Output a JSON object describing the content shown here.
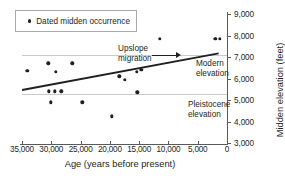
{
  "chart_data": {
    "type": "scatter",
    "title": "",
    "xlabel": "Age (years before present)",
    "ylabel": "Midden elevation (feet)",
    "xlim": [
      35000,
      0
    ],
    "ylim": [
      3000,
      9000
    ],
    "x_ticks": [
      "35,000",
      "30,000",
      "25,000",
      "20,000",
      "15,000",
      "10,000",
      "5,000",
      "0"
    ],
    "x_tick_values": [
      35000,
      30000,
      25000,
      20000,
      15000,
      10000,
      5000,
      0
    ],
    "y_ticks": [
      "9,000",
      "8,000",
      "7,000",
      "6,000",
      "5,000",
      "4,000",
      "3,000"
    ],
    "y_tick_values": [
      9000,
      8000,
      7000,
      6000,
      5000,
      4000,
      3000
    ],
    "grid": false,
    "legend_position": "top-left",
    "legend": [
      "Dated midden occurrence"
    ],
    "series": [
      {
        "name": "Dated midden occurrence",
        "points": [
          {
            "x": 34100,
            "y": 6350
          },
          {
            "x": 30500,
            "y": 6700
          },
          {
            "x": 30400,
            "y": 5400
          },
          {
            "x": 30100,
            "y": 4900
          },
          {
            "x": 29400,
            "y": 5400
          },
          {
            "x": 29200,
            "y": 6300
          },
          {
            "x": 28300,
            "y": 5400
          },
          {
            "x": 26400,
            "y": 6700
          },
          {
            "x": 24700,
            "y": 4900
          },
          {
            "x": 19700,
            "y": 4250
          },
          {
            "x": 18400,
            "y": 6100
          },
          {
            "x": 17500,
            "y": 5950
          },
          {
            "x": 15400,
            "y": 6300
          },
          {
            "x": 15300,
            "y": 5350
          },
          {
            "x": 14600,
            "y": 6400
          },
          {
            "x": 11500,
            "y": 7850
          },
          {
            "x": 2000,
            "y": 7850
          },
          {
            "x": 1200,
            "y": 7850
          }
        ]
      }
    ],
    "trend_line": {
      "name": "upslope migration trend",
      "x_start": 35000,
      "y_start": 5500,
      "x_end": 1500,
      "y_end": 7200
    },
    "reference_lines": [
      {
        "label": "Modern elevation",
        "y": 7100
      },
      {
        "label": "Pleistocene elevation",
        "y": 5300
      }
    ],
    "annotations": [
      {
        "name": "upslope-migration",
        "line1": "Upslope",
        "line2": "migration"
      },
      {
        "name": "modern-elevation",
        "line1": "Modern",
        "line2": "elevation"
      },
      {
        "name": "pleistocene-elevation",
        "line1": "Pleistocene",
        "line2": "elevation"
      }
    ]
  }
}
